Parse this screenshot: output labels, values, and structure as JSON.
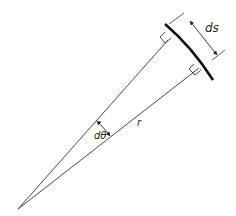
{
  "diagram": {
    "labels": {
      "arc_length": "ds",
      "angle": "dθ",
      "radius": "r"
    },
    "colors": {
      "line": "#333333",
      "arc": "#111111",
      "background": "#ffffff"
    }
  }
}
